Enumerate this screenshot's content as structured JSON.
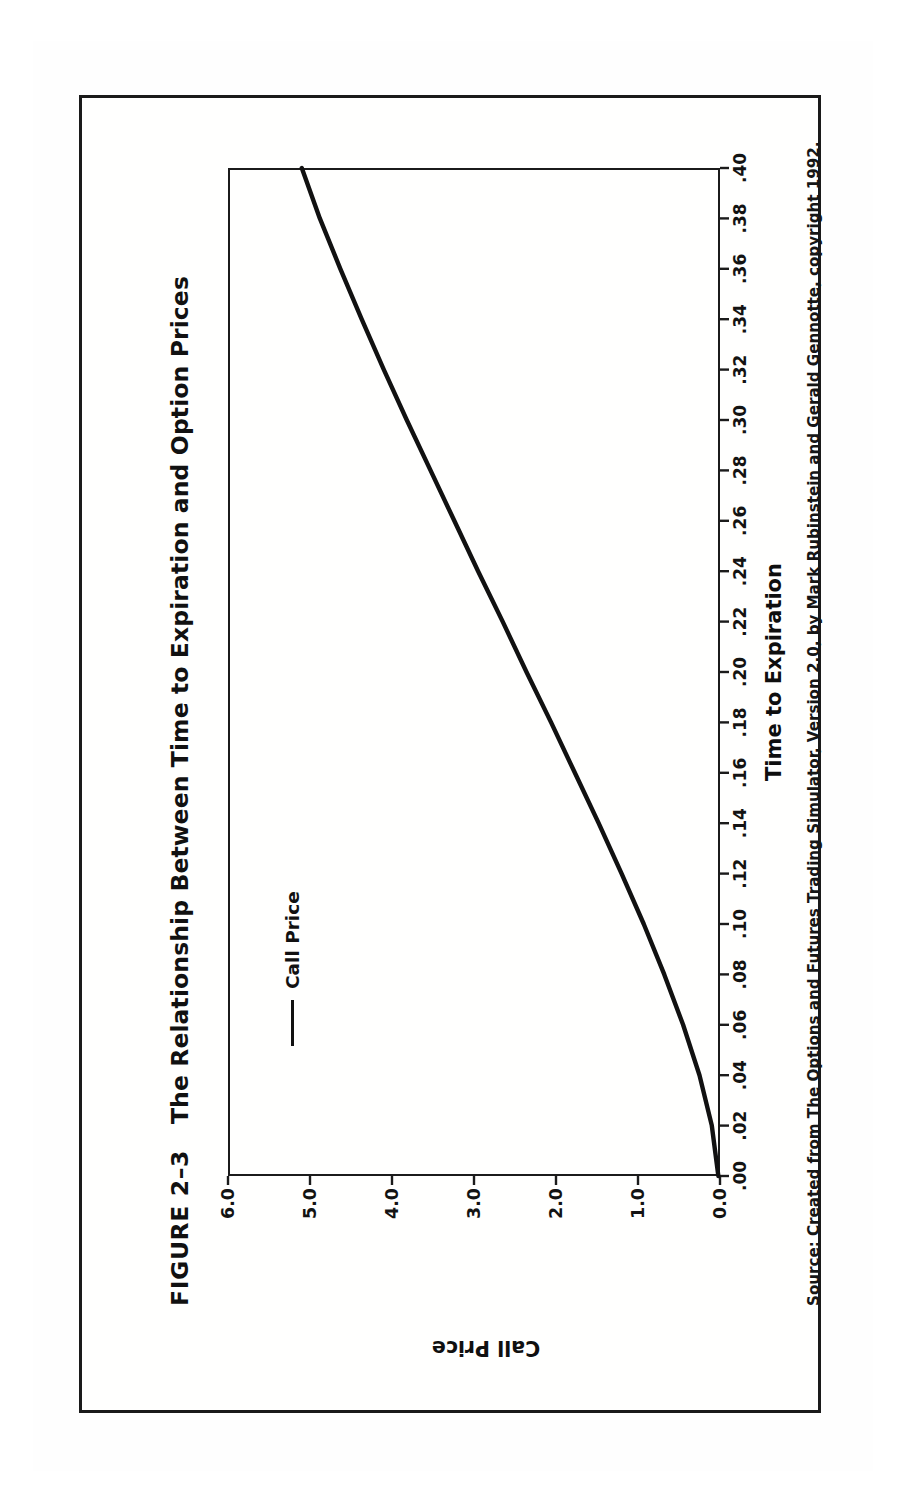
{
  "figure": {
    "number_label": "FIGURE 2–3",
    "title": "The Relationship Between Time to Expiration and Option Prices",
    "source": "Source: Created from The Options and Futures Trading Simulator, Version 2.0, by Mark Rubinstein and Gerald Gennotte, copyright 1992.",
    "border_color": "#1a1a1a",
    "page_background": "#ffffff"
  },
  "legend": {
    "position": "top-left-inside-plot",
    "entries": [
      {
        "label": "Call Price",
        "color": "#111111",
        "marker": "line-swatch"
      }
    ]
  },
  "chart_data": {
    "type": "line",
    "title": "The Relationship Between Time to Expiration and Option Prices",
    "subtitle": "",
    "xlabel": "Time to Expiration",
    "ylabel": "Call Price",
    "xlim": [
      0.0,
      0.4
    ],
    "ylim": [
      0.0,
      6.0
    ],
    "grid": false,
    "legend_position": "upper left",
    "line_color": "#111111",
    "line_width_px": 4,
    "x_tick_labels": [
      ".00",
      ".02",
      ".04",
      ".06",
      ".08",
      ".10",
      ".12",
      ".14",
      ".16",
      ".18",
      ".20",
      ".22",
      ".24",
      ".26",
      ".28",
      ".30",
      ".32",
      ".34",
      ".36",
      ".38",
      ".40"
    ],
    "x_tick_values": [
      0.0,
      0.02,
      0.04,
      0.06,
      0.08,
      0.1,
      0.12,
      0.14,
      0.16,
      0.18,
      0.2,
      0.22,
      0.24,
      0.26,
      0.28,
      0.3,
      0.32,
      0.34,
      0.36,
      0.38,
      0.4
    ],
    "y_tick_labels": [
      "0.0",
      "1.0",
      "2.0",
      "3.0",
      "4.0",
      "5.0",
      "6.0"
    ],
    "y_tick_values": [
      0.0,
      1.0,
      2.0,
      3.0,
      4.0,
      5.0,
      6.0
    ],
    "series": [
      {
        "name": "Call Price",
        "x": [
          0.0,
          0.02,
          0.04,
          0.06,
          0.08,
          0.1,
          0.12,
          0.14,
          0.16,
          0.18,
          0.2,
          0.22,
          0.24,
          0.26,
          0.28,
          0.3,
          0.32,
          0.34,
          0.36,
          0.38,
          0.4
        ],
        "values": [
          0.02,
          0.1,
          0.25,
          0.45,
          0.68,
          0.93,
          1.2,
          1.48,
          1.77,
          2.06,
          2.36,
          2.65,
          2.95,
          3.24,
          3.53,
          3.82,
          4.1,
          4.37,
          4.63,
          4.88,
          5.1
        ]
      }
    ],
    "annotations": []
  }
}
